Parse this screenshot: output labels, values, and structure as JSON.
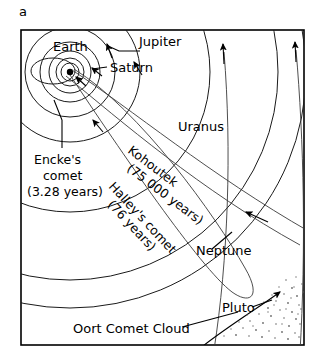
{
  "figure": {
    "panel_label": "a",
    "type": "solar-system-schematic"
  },
  "labels": {
    "earth": "Earth",
    "jupiter": "Jupiter",
    "saturn": "Saturn",
    "uranus": "Uranus",
    "neptune": "Neptune",
    "pluto": "Pluto",
    "oort_cloud": "Oort Comet Cloud",
    "enckes_line1": "Encke's",
    "enckes_line2": "comet",
    "enckes_line3": "(3.28 years)",
    "kohoutek_name": "Kohoutek",
    "kohoutek_period": "(75 000 years)",
    "halley_name": "Halley's comet",
    "halley_period": "(76 years)"
  },
  "colors": {
    "background": "#ffffff",
    "ink": "#000000",
    "orbit": "#1a1a1a",
    "stipple": "#6b6b6b"
  },
  "objects": [
    {
      "name": "Sun",
      "kind": "star"
    },
    {
      "name": "Earth",
      "kind": "planet-orbit"
    },
    {
      "name": "Jupiter",
      "kind": "planet-orbit"
    },
    {
      "name": "Saturn",
      "kind": "planet-orbit"
    },
    {
      "name": "Uranus",
      "kind": "planet-orbit"
    },
    {
      "name": "Neptune",
      "kind": "planet-orbit"
    },
    {
      "name": "Pluto",
      "kind": "planet-orbit"
    },
    {
      "name": "Encke's comet",
      "period": "3.28 years",
      "kind": "comet-orbit"
    },
    {
      "name": "Halley's comet",
      "period": "76 years",
      "kind": "comet-orbit"
    },
    {
      "name": "Kohoutek",
      "period": "75 000 years",
      "kind": "comet-orbit"
    },
    {
      "name": "Oort Comet Cloud",
      "kind": "cloud"
    }
  ]
}
